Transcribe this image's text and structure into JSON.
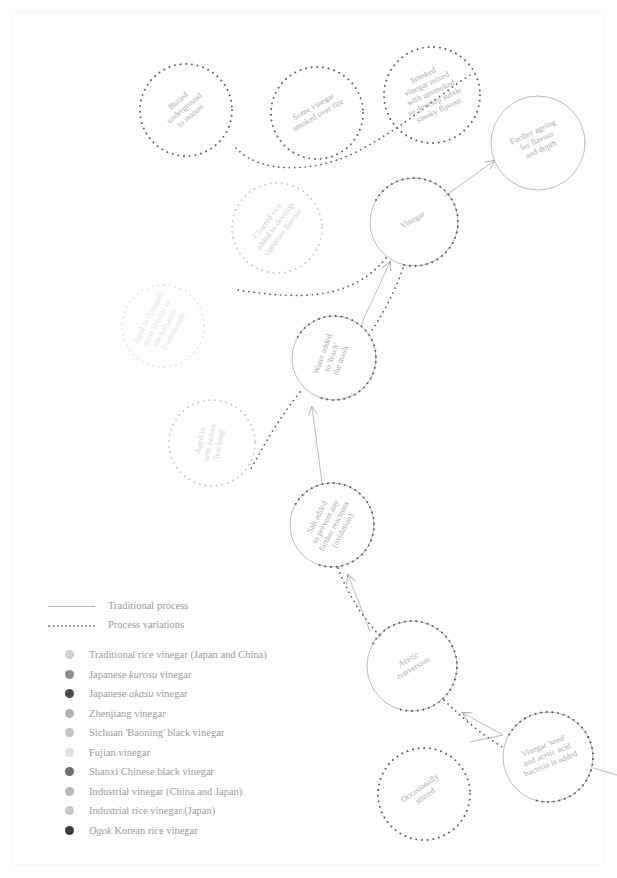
{
  "diagram": {
    "nodes": [
      {
        "id": "buried-underground",
        "label": "Buried underground to mature",
        "lines": [
          "Buried",
          "underground",
          "to mature"
        ],
        "cx": 186,
        "cy": 110,
        "r": 46,
        "style": "dotted",
        "rotate": -40,
        "tone": "normal"
      },
      {
        "id": "some-vinegar-smoked",
        "label": "Some vinegar smoked over fire",
        "lines": [
          "Some vinegar",
          "smoked over fire"
        ],
        "cx": 317,
        "cy": 113,
        "r": 46,
        "style": "dotted",
        "rotate": -30,
        "tone": "normal"
      },
      {
        "id": "smoked-vinegar-mixed",
        "label": "Smoked vinegar mixed with unsmoked to develop subtle smoky flavour",
        "lines": [
          "Smoked",
          "vinegar mixed",
          "with unsmoked",
          "to develop subtle",
          "smoky flavour"
        ],
        "cx": 432,
        "cy": 95,
        "r": 48,
        "style": "dotted",
        "rotate": -25,
        "tone": "normal"
      },
      {
        "id": "further-ageing",
        "label": "Further ageing for flavour and depth",
        "lines": [
          "Further ageing",
          "for flavour",
          "and depth"
        ],
        "cx": 538,
        "cy": 143,
        "r": 47,
        "style": "solid-light",
        "rotate": -25,
        "tone": "normal"
      },
      {
        "id": "charred-rice",
        "label": "Charred rice added to develop signature flavour",
        "lines": [
          "Charred rice",
          "added to develop",
          "signature flavour"
        ],
        "cx": 277,
        "cy": 228,
        "r": 45,
        "style": "dotted-pale",
        "rotate": -53,
        "tone": "lighter"
      },
      {
        "id": "vinegar",
        "label": "Vinegar",
        "lines": [
          "Vinegar"
        ],
        "cx": 414,
        "cy": 222,
        "r": 44,
        "style": "solid-dotted",
        "rotate": -30,
        "tone": "normal"
      },
      {
        "id": "aged-dynamic",
        "label": "Aged in dynamic style similar to the balsamic Tradizionale",
        "lines": [
          "Aged in dynamic",
          "style similar to",
          "the balsamic",
          "Tradizionale"
        ],
        "cx": 163,
        "cy": 326,
        "r": 41,
        "style": "dotted-palest",
        "rotate": -62,
        "tone": "lightest"
      },
      {
        "id": "water-added",
        "label": "Water added to 'leach' the mash",
        "lines": [
          "Water added",
          "to 'leach'",
          "the mash"
        ],
        "cx": 334,
        "cy": 358,
        "r": 42,
        "style": "solid-dotted",
        "rotate": -70,
        "tone": "normal"
      },
      {
        "id": "aged-urns",
        "label": "Aged in urns before 'leaching'",
        "lines": [
          "Aged in",
          "urns before",
          "'leaching'"
        ],
        "cx": 212,
        "cy": 443,
        "r": 43,
        "style": "dotted-pale",
        "rotate": -78,
        "tone": "lighter"
      },
      {
        "id": "salt-added",
        "label": "Salt added to prevent any further reactions (oxidation)",
        "lines": [
          "Salt added",
          "to prevent any",
          "further reactions",
          "(oxidation)"
        ],
        "cx": 332,
        "cy": 525,
        "r": 42,
        "style": "solid-dotted",
        "rotate": -62,
        "tone": "normal"
      },
      {
        "id": "acetic-conversion",
        "label": "Acetic conversion",
        "lines": [
          "Acetic",
          "conversion"
        ],
        "cx": 412,
        "cy": 666,
        "r": 45,
        "style": "solid-dotted",
        "rotate": -30,
        "tone": "normal"
      },
      {
        "id": "vinegar-seed",
        "label": "Vinegar 'seed' and acetic acid bacteria is added",
        "lines": [
          "Vinegar 'seed'",
          "and acetic acid",
          "bacteria is added"
        ],
        "cx": 548,
        "cy": 757,
        "r": 45,
        "style": "solid-dotted",
        "rotate": -22,
        "tone": "normal"
      },
      {
        "id": "occasionally-stirred",
        "label": "Occasionally stirred",
        "lines": [
          "Occasionally",
          "stirred"
        ],
        "cx": 424,
        "cy": 794,
        "r": 46,
        "style": "dotted",
        "rotate": -35,
        "tone": "normal"
      }
    ],
    "legend_lines": [
      {
        "id": "traditional-process",
        "label": "Traditional process",
        "style": "solid"
      },
      {
        "id": "process-variations",
        "label": "Process variations",
        "style": "dotted"
      }
    ],
    "legend_items": [
      {
        "id": "traditional-rice-vinegar",
        "pre": "Traditional rice vinegar (Japan and China)",
        "em": "",
        "post": "",
        "color": "#cfcfcf"
      },
      {
        "id": "japanese-kurosu-vinegar",
        "pre": "Japanese ",
        "em": "kurosu",
        "post": " vinegar",
        "color": "#8d8d8d"
      },
      {
        "id": "japanese-akasu-vinegar",
        "pre": "Japanese ",
        "em": "akasu",
        "post": " vinegar",
        "color": "#4a4a4a"
      },
      {
        "id": "zhenjiang-vinegar",
        "pre": "Zhenjiang vinegar",
        "em": "",
        "post": "",
        "color": "#b0b0b0"
      },
      {
        "id": "sichuan-baoning-vinegar",
        "pre": "Sichuan 'Baoning' black vinegar",
        "em": "",
        "post": "",
        "color": "#c4c4c4"
      },
      {
        "id": "fujian-vinegar",
        "pre": "Fujian vinegar",
        "em": "",
        "post": "",
        "color": "#e0e0e0"
      },
      {
        "id": "shanxi-chinese-black",
        "pre": "Shanxi Chinese black vinegar",
        "em": "",
        "post": "",
        "color": "#6f6f6f"
      },
      {
        "id": "industrial-vinegar",
        "pre": "Industrial vinegar (China and Japan)",
        "em": "",
        "post": "",
        "color": "#b8b8b8"
      },
      {
        "id": "industrial-rice-vinegar-jp",
        "pre": "Industrial rice vinegar (Japan)",
        "em": "",
        "post": "",
        "color": "#c9c9c9"
      },
      {
        "id": "ogok-korean-rice-vinegar",
        "pre": "",
        "em": "Ogok",
        "post": " Korean rice vinegar",
        "color": "#3d3d3d"
      }
    ],
    "colors": {
      "solid_stroke": "#b4b4b4",
      "dotted_stroke": "#5a5a5a",
      "dotted_pale": "#c8c8c8",
      "dotted_palest": "#e2e2e2",
      "text": "#a8a8a8",
      "frame": "#f0f0f0",
      "background": "#ffffff"
    }
  }
}
